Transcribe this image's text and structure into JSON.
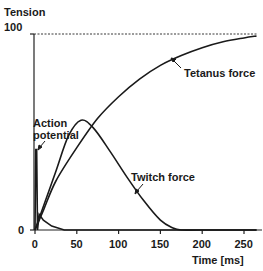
{
  "chart_data": {
    "type": "line",
    "title": "",
    "xlabel": "Time [ms]",
    "ylabel": "Tension",
    "xlim": [
      0,
      265
    ],
    "ylim": [
      0,
      100
    ],
    "x_ticks": [
      "0",
      "50",
      "100",
      "150",
      "200",
      "250"
    ],
    "y_ticks": [
      "0",
      "100"
    ],
    "grid": false,
    "reference_line": {
      "y": 100,
      "style": "dashed"
    },
    "series": [
      {
        "name": "Tetanus force",
        "x": [
          0,
          10,
          25,
          50,
          75,
          100,
          125,
          150,
          175,
          200,
          225,
          250,
          265
        ],
        "values": [
          0,
          10,
          25,
          42,
          57,
          68,
          77,
          84,
          89,
          93,
          96,
          98,
          99
        ]
      },
      {
        "name": "Twitch force",
        "x": [
          0,
          10,
          25,
          40,
          55,
          70,
          90,
          110,
          130,
          150,
          165,
          175,
          200,
          265
        ],
        "values": [
          0,
          12,
          30,
          48,
          56,
          52,
          40,
          27,
          15,
          5,
          1,
          0,
          0,
          0
        ]
      },
      {
        "name": "Action potential",
        "x": [
          0,
          1,
          2,
          3,
          5,
          10,
          20,
          35,
          265
        ],
        "values": [
          0,
          41,
          41,
          0,
          8,
          5,
          2,
          0,
          0
        ]
      }
    ],
    "annotations": [
      {
        "text": "Tetanus force",
        "x": 145,
        "y": 80
      },
      {
        "text": "Twitch force",
        "x": 115,
        "y": 36
      },
      {
        "text": "Action potential",
        "x": 5,
        "y": 55
      }
    ]
  },
  "labels": {
    "y_axis_title": "Tension",
    "y_top": "100",
    "y_zero": "0",
    "x_axis_title": "Time [ms]",
    "x_ticks": [
      "0",
      "50",
      "100",
      "150",
      "200",
      "250"
    ],
    "tetanus": "Tetanus force",
    "twitch": "Twitch force",
    "action_1": "Action",
    "action_2": "potential"
  }
}
